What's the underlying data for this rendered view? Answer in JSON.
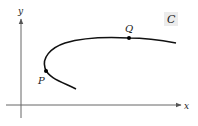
{
  "diagram": {
    "axes": {
      "x_label": "x",
      "y_label": "y"
    },
    "curve": {
      "label": "C",
      "color": "#111111"
    },
    "points": [
      {
        "name": "P",
        "label": "P"
      },
      {
        "name": "Q",
        "label": "Q"
      }
    ],
    "label_box_color": "#ececec"
  }
}
